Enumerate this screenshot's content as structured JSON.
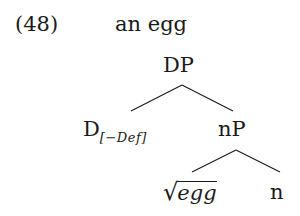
{
  "example": {
    "number": "(48)",
    "gloss": "an egg"
  },
  "tree": {
    "root": {
      "label": "DP"
    },
    "left_child": {
      "label": "D",
      "feature": "[−Def]"
    },
    "right_child": {
      "label": "nP"
    },
    "grandchildren": {
      "root_node": {
        "radical": "√",
        "label": "egg"
      },
      "head": {
        "label": "n"
      }
    },
    "edges": [
      {
        "from": "DP",
        "to": "D[-Def]"
      },
      {
        "from": "DP",
        "to": "nP"
      },
      {
        "from": "nP",
        "to": "√egg"
      },
      {
        "from": "nP",
        "to": "n"
      }
    ]
  }
}
